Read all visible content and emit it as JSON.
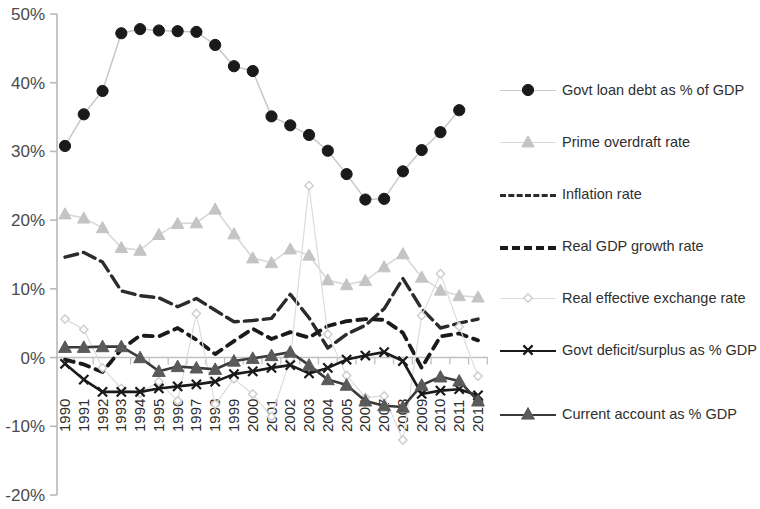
{
  "chart_data": {
    "type": "line",
    "title": "",
    "xlabel": "",
    "ylabel": "",
    "x": [
      1990,
      1991,
      1992,
      1993,
      1994,
      1995,
      1996,
      1997,
      1998,
      1999,
      2000,
      2001,
      2002,
      2003,
      2004,
      2005,
      2006,
      2007,
      2008,
      2009,
      2010,
      2011,
      2012
    ],
    "categories": [
      "1990",
      "1991",
      "1992",
      "1993",
      "1994",
      "1995",
      "1996",
      "1997",
      "1998",
      "1999",
      "2000",
      "2001",
      "2002",
      "2003",
      "2004",
      "2005",
      "2006",
      "2007",
      "2008",
      "2009",
      "2010",
      "2011",
      "2012"
    ],
    "ylim": [
      -20,
      50
    ],
    "yticks": [
      -20,
      -10,
      0,
      10,
      20,
      30,
      40,
      50
    ],
    "ytick_labels": [
      "-20%",
      "-10%",
      "0%",
      "10%",
      "20%",
      "30%",
      "40%",
      "50%"
    ],
    "grid": false,
    "legend_position": "right",
    "series": [
      {
        "name": "Govt loan debt as % of GDP",
        "marker": "circle-filled",
        "color": "#1a1a1a",
        "line_color": "#c8c8c8",
        "values": [
          30.8,
          35.4,
          38.8,
          47.2,
          47.8,
          47.6,
          47.5,
          47.4,
          45.5,
          42.4,
          41.7,
          35.1,
          33.8,
          32.4,
          30.1,
          26.7,
          23.0,
          23.1,
          27.1,
          30.2,
          32.8,
          36.0,
          null
        ]
      },
      {
        "name": "Prime overdraft rate",
        "marker": "triangle-light",
        "color": "#c4c4c4",
        "line_color": "#d8d8d8",
        "values": [
          20.9,
          20.3,
          18.9,
          16.0,
          15.6,
          17.9,
          19.5,
          19.6,
          21.6,
          18.0,
          14.5,
          13.8,
          15.8,
          14.9,
          11.3,
          10.6,
          11.2,
          13.2,
          15.1,
          11.7,
          9.8,
          9.0,
          8.8
        ]
      },
      {
        "name": "Inflation rate",
        "marker": "none",
        "color": "#2b2b2b",
        "line_color": "#2b2b2b",
        "dash": "long",
        "values": [
          14.6,
          15.3,
          13.9,
          9.7,
          9.0,
          8.7,
          7.4,
          8.6,
          6.9,
          5.2,
          5.4,
          5.7,
          9.2,
          5.8,
          1.4,
          3.4,
          4.7,
          7.1,
          11.5,
          7.1,
          4.3,
          5.0,
          5.6
        ]
      },
      {
        "name": "Real GDP growth rate",
        "marker": "none",
        "color": "#1a1a1a",
        "line_color": "#1a1a1a",
        "dash": "short",
        "values": [
          -0.3,
          -1.0,
          -2.1,
          1.2,
          3.2,
          3.1,
          4.3,
          2.6,
          0.5,
          2.4,
          4.2,
          2.7,
          3.7,
          2.9,
          4.6,
          5.3,
          5.6,
          5.5,
          3.6,
          -1.5,
          3.1,
          3.5,
          2.5
        ]
      },
      {
        "name": "Real effective exchange rate",
        "marker": "diamond-open",
        "color": "#cccccc",
        "line_color": "#dcdcdc",
        "values": [
          5.6,
          4.1,
          -1.5,
          -4.5,
          -5.2,
          -3.5,
          -6.3,
          6.4,
          -6.8,
          -3.1,
          -5.3,
          -8.6,
          -0.2,
          25.0,
          3.4,
          -2.6,
          -5.8,
          -5.6,
          -12.0,
          6.1,
          12.2,
          4.5,
          -2.7
        ]
      },
      {
        "name": "Govt deficit/surplus as % GDP",
        "marker": "x-cross",
        "color": "#1a1a1a",
        "line_color": "#1a1a1a",
        "values": [
          -0.9,
          -3.2,
          -5.0,
          -5.0,
          -5.0,
          -4.5,
          -4.2,
          -3.9,
          -3.5,
          -2.4,
          -2.0,
          -1.5,
          -1.1,
          -2.3,
          -1.5,
          -0.3,
          0.3,
          0.8,
          -0.5,
          -5.3,
          -4.8,
          -4.6,
          -5.5
        ]
      },
      {
        "name": "Current account as % GDP",
        "marker": "triangle-filled",
        "color": "#5a5a5a",
        "line_color": "#3a3a3a",
        "values": [
          1.5,
          1.5,
          1.6,
          1.6,
          0.0,
          -2.0,
          -1.3,
          -1.5,
          -1.7,
          -0.5,
          -0.1,
          0.3,
          0.8,
          -1.1,
          -3.2,
          -4.0,
          -6.3,
          -7.0,
          -7.2,
          -4.0,
          -2.8,
          -3.4,
          -6.3
        ]
      }
    ]
  },
  "legend": {
    "items": [
      {
        "label": "Govt loan debt as % of GDP",
        "key": "circle-filled-key"
      },
      {
        "label": "Prime overdraft rate",
        "key": "triangle-light-key"
      },
      {
        "label": "Inflation rate",
        "key": "long-dash-key"
      },
      {
        "label": "Real GDP growth rate",
        "key": "short-dash-key"
      },
      {
        "label": "Real effective exchange rate",
        "key": "diamond-open-key"
      },
      {
        "label": "Govt deficit/surplus as % GDP",
        "key": "x-cross-key"
      },
      {
        "label": "Current account as % GDP",
        "key": "triangle-filled-key"
      }
    ]
  }
}
